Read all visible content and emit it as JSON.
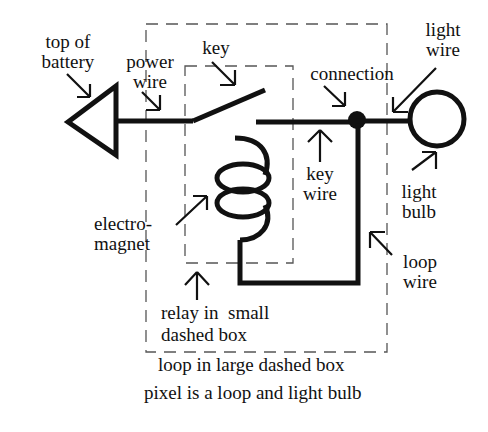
{
  "diagram": {
    "labels": {
      "top_of_battery": [
        "top of",
        "battery"
      ],
      "power_wire": [
        "power",
        "wire"
      ],
      "key": "key",
      "connection": "connection",
      "light_wire": [
        "light",
        "wire"
      ],
      "key_wire": [
        "key",
        "wire"
      ],
      "light_bulb": [
        "light",
        "bulb"
      ],
      "electromagnet": [
        "electro-",
        "magnet"
      ],
      "loop_wire": [
        "loop",
        "wire"
      ],
      "relay_note": [
        "relay in  small",
        "dashed box"
      ],
      "loop_note": "loop in large dashed box",
      "pixel_note": "pixel is a loop and light bulb"
    },
    "components": [
      "battery",
      "power wire",
      "key",
      "key wire",
      "connection",
      "light wire",
      "light bulb",
      "electromagnet",
      "loop wire",
      "relay (small dashed box)",
      "loop (large dashed box)"
    ],
    "colors": {
      "ink": "#111111",
      "dash": "#555555",
      "background": "#ffffff"
    }
  }
}
